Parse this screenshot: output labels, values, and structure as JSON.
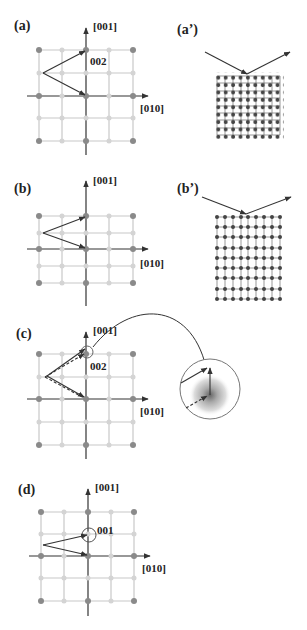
{
  "figure": {
    "panels": [
      {
        "id": "a",
        "label": "(a)",
        "axis_vertical": "[001]",
        "axis_horizontal": "[010]",
        "reflection": "002"
      },
      {
        "id": "a_prime",
        "label": "(a’)",
        "lattice": {
          "columns": 9,
          "rows": 9
        }
      },
      {
        "id": "b",
        "label": "(b)",
        "axis_vertical": "[001]",
        "axis_horizontal": "[010]"
      },
      {
        "id": "b_prime",
        "label": "(b’)",
        "lattice": {
          "columns": 9,
          "rows": 9
        }
      },
      {
        "id": "c",
        "label": "(c)",
        "axis_vertical": "[001]",
        "axis_horizontal": "[010]",
        "reflection": "002"
      },
      {
        "id": "d",
        "label": "(d)",
        "axis_vertical": "[001]",
        "axis_horizontal": "[010]",
        "reflection": "001"
      }
    ],
    "colors": {
      "grid_line": "#c8c8c8",
      "dot_dark": "#8a8a8a",
      "dot_light": "#d4d4d4",
      "axis": "#333333",
      "lattice_atom": "#444444",
      "halo": "#9a9a9a"
    }
  }
}
